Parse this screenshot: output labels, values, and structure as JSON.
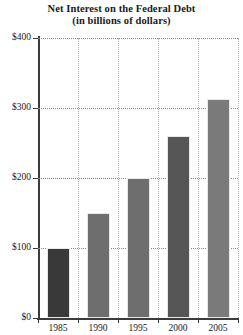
{
  "title": {
    "line1": "Net Interest on the Federal Debt",
    "line2": "(in billions of dollars)"
  },
  "axis": {
    "y_ticks": [
      "$0",
      "$100",
      "$200",
      "$300",
      "$400"
    ],
    "x_ticks": [
      "1985",
      "1990",
      "1995",
      "2000",
      "2005"
    ]
  },
  "chart_data": {
    "type": "bar",
    "title": "Net Interest on the Federal Debt (in billions of dollars)",
    "xlabel": "",
    "ylabel": "",
    "categories": [
      "1985",
      "1990",
      "1995",
      "2000",
      "2005"
    ],
    "values": [
      100,
      150,
      200,
      260,
      313
    ],
    "ylim": [
      0,
      400
    ],
    "ytick_values": [
      0,
      100,
      200,
      300,
      400
    ],
    "ytick_labels": [
      "$0",
      "$100",
      "$200",
      "$300",
      "$400"
    ],
    "grid": "horizontal-dotted-and-vertical-dotted",
    "legend": "none",
    "bar_colors": [
      "#393939",
      "#6e6e6e",
      "#6e6e6e",
      "#565656",
      "#7a7a7a"
    ]
  }
}
